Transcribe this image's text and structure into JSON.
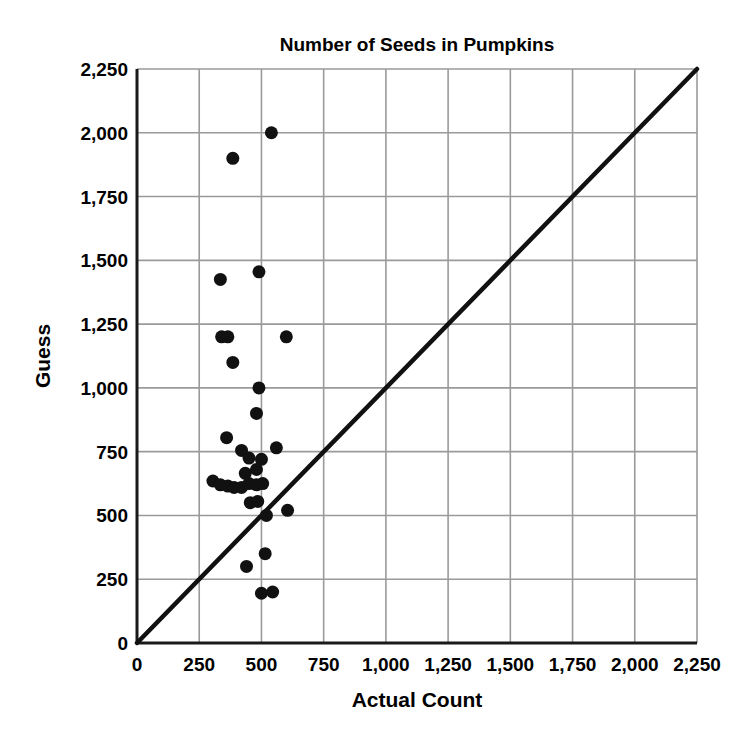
{
  "chart_data": {
    "type": "scatter",
    "title": "Number of Seeds in Pumpkins",
    "xlabel": "Actual Count",
    "ylabel": "Guess",
    "xlim": [
      0,
      2250
    ],
    "ylim": [
      0,
      2250
    ],
    "xticks": [
      0,
      250,
      500,
      750,
      1000,
      1250,
      1500,
      1750,
      2000,
      2250
    ],
    "yticks": [
      0,
      250,
      500,
      750,
      1000,
      1250,
      1500,
      1750,
      2000,
      2250
    ],
    "xtick_labels": [
      "0",
      "250",
      "500",
      "750",
      "1,000",
      "1,250",
      "1,500",
      "1,750",
      "2,000",
      "2,250"
    ],
    "ytick_labels": [
      "0",
      "250",
      "500",
      "750",
      "1,000",
      "1,250",
      "1,500",
      "1,750",
      "2,000",
      "2,250"
    ],
    "grid": true,
    "legend": null,
    "reference_line": {
      "label": "y = x",
      "from": [
        0,
        0
      ],
      "to": [
        2250,
        2250
      ]
    },
    "points": [
      {
        "x": 540,
        "y": 2000
      },
      {
        "x": 385,
        "y": 1900
      },
      {
        "x": 335,
        "y": 1425
      },
      {
        "x": 490,
        "y": 1455
      },
      {
        "x": 340,
        "y": 1200
      },
      {
        "x": 365,
        "y": 1200
      },
      {
        "x": 600,
        "y": 1200
      },
      {
        "x": 385,
        "y": 1100
      },
      {
        "x": 490,
        "y": 1000
      },
      {
        "x": 480,
        "y": 900
      },
      {
        "x": 360,
        "y": 805
      },
      {
        "x": 560,
        "y": 765
      },
      {
        "x": 420,
        "y": 755
      },
      {
        "x": 450,
        "y": 725
      },
      {
        "x": 500,
        "y": 720
      },
      {
        "x": 480,
        "y": 680
      },
      {
        "x": 435,
        "y": 665
      },
      {
        "x": 305,
        "y": 635
      },
      {
        "x": 335,
        "y": 620
      },
      {
        "x": 365,
        "y": 615
      },
      {
        "x": 390,
        "y": 610
      },
      {
        "x": 420,
        "y": 610
      },
      {
        "x": 450,
        "y": 625
      },
      {
        "x": 480,
        "y": 620
      },
      {
        "x": 505,
        "y": 625
      },
      {
        "x": 455,
        "y": 550
      },
      {
        "x": 485,
        "y": 555
      },
      {
        "x": 520,
        "y": 500
      },
      {
        "x": 605,
        "y": 520
      },
      {
        "x": 515,
        "y": 350
      },
      {
        "x": 440,
        "y": 300
      },
      {
        "x": 500,
        "y": 195
      },
      {
        "x": 545,
        "y": 200
      }
    ]
  },
  "colors": {
    "point": "#111111",
    "grid": "#9a9a9a",
    "axis": "#1a1a1a",
    "line": "#111111"
  }
}
